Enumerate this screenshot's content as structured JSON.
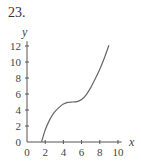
{
  "problem": {
    "number": "23."
  },
  "chart_data": {
    "type": "line",
    "title": "",
    "xlabel": "x",
    "ylabel": "y",
    "xlim": [
      0,
      10
    ],
    "ylim": [
      0,
      12
    ],
    "x_ticks": [
      0,
      2,
      4,
      6,
      8,
      10
    ],
    "y_ticks": [
      0,
      2,
      4,
      6,
      8,
      10,
      12
    ],
    "x_tick_labels": [
      "0",
      "2",
      "4",
      "6",
      "8",
      "10"
    ],
    "y_tick_labels": [
      "0",
      "2",
      "4",
      "6",
      "8",
      "10",
      "12"
    ],
    "grid": false,
    "legend": null,
    "series": [
      {
        "name": "f(x)",
        "description": "cubic-like curve with plateau (inflection) near (5, 5)",
        "x": [
          1.6,
          2.0,
          2.5,
          3.0,
          3.5,
          4.0,
          4.5,
          5.0,
          5.5,
          6.0,
          6.5,
          7.0,
          7.5,
          8.0,
          8.5,
          9.0
        ],
        "y": [
          0.0,
          1.5,
          2.8,
          3.7,
          4.3,
          4.75,
          4.95,
          5.0,
          5.05,
          5.3,
          5.9,
          6.8,
          7.9,
          9.1,
          10.5,
          12.1
        ]
      }
    ],
    "colors": {
      "curve": "#666666",
      "axes": "#555555"
    }
  }
}
